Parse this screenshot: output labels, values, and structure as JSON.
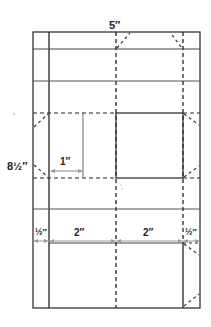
{
  "diagram": {
    "dimensions": {
      "width_label": "5″",
      "height_label": "8½″",
      "square_offset_label": "1″",
      "segment_labels": [
        "½″",
        "2″",
        "2″",
        "½″"
      ]
    },
    "legend": {
      "solid_line": "cut / edge",
      "dashed_line": "fold",
      "gray_arrow": "measurement"
    },
    "colors": {
      "line": "#333333",
      "dim_line": "#9a9a9a",
      "background": "#ffffff"
    }
  }
}
